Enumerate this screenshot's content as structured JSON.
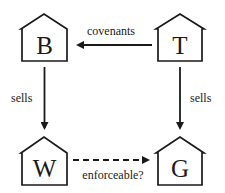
{
  "diagram": {
    "nodes": [
      {
        "id": "B",
        "label": "B",
        "shape": "house"
      },
      {
        "id": "T",
        "label": "T",
        "shape": "house"
      },
      {
        "id": "W",
        "label": "W",
        "shape": "house"
      },
      {
        "id": "G",
        "label": "G",
        "shape": "house"
      }
    ],
    "edges": [
      {
        "from": "T",
        "to": "B",
        "label": "covenants",
        "style": "solid"
      },
      {
        "from": "B",
        "to": "W",
        "label": "sells",
        "style": "solid"
      },
      {
        "from": "T",
        "to": "G",
        "label": "sells",
        "style": "solid"
      },
      {
        "from": "W",
        "to": "G",
        "label": "enforceable?",
        "style": "dashed"
      }
    ]
  }
}
